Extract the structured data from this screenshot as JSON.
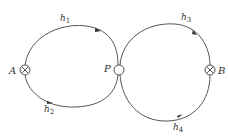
{
  "diagram": {
    "type": "network-loops",
    "colors": {
      "stroke": "#555555",
      "text": "#333333",
      "background": "#ffffff"
    },
    "nodes": [
      {
        "id": "A",
        "label": "A",
        "symbol": "circle-cross"
      },
      {
        "id": "P",
        "label": "P",
        "symbol": "open-circle"
      },
      {
        "id": "B",
        "label": "B",
        "symbol": "circle-cross"
      }
    ],
    "paths": [
      {
        "id": "h1",
        "label": "h",
        "subscript": "1",
        "from": "A",
        "to": "P",
        "side": "upper-left"
      },
      {
        "id": "h2",
        "label": "h",
        "subscript": "2",
        "from": "P",
        "to": "A",
        "side": "lower-left"
      },
      {
        "id": "h3",
        "label": "h",
        "subscript": "3",
        "from": "P",
        "to": "B",
        "side": "upper-right"
      },
      {
        "id": "h4",
        "label": "h",
        "subscript": "4",
        "from": "B",
        "to": "P",
        "side": "lower-right"
      }
    ]
  }
}
